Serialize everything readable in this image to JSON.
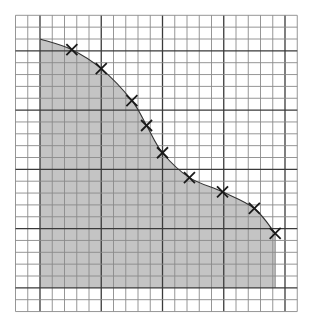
{
  "chart_data": {
    "type": "area",
    "title": "",
    "xlabel": "",
    "ylabel": "",
    "grid": true,
    "grid_columns": 23,
    "grid_rows": 25,
    "major_line_every": 5,
    "area_origin_cell": {
      "col": 2,
      "row_from_top": 23
    },
    "area": {
      "x_start": 0,
      "x_end": 19.2,
      "curve_start": {
        "x": 0,
        "y": 21.0
      }
    },
    "markers": {
      "symbol": "x",
      "x": [
        2.6,
        5.0,
        7.5,
        8.7,
        10.0,
        12.2,
        14.9,
        17.5,
        19.2
      ],
      "y": [
        20.1,
        18.5,
        15.8,
        13.7,
        11.4,
        9.3,
        8.1,
        6.7,
        4.6
      ]
    },
    "colors": {
      "fill": "#c4c4c4",
      "grid_minor": "#8a8a8a",
      "grid_major": "#3a3a3a",
      "curve": "#333333",
      "marker": "#1a1a1a",
      "background": "#ffffff"
    }
  }
}
